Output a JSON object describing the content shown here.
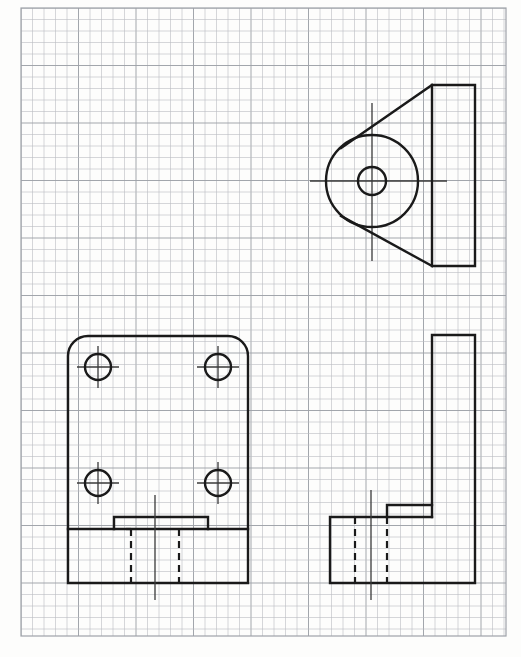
{
  "document": {
    "kind": "engineering-orthographic-drawing",
    "medium": "graph-paper",
    "title": "Three-view orthographic sketch of a bracket",
    "view_count": 3,
    "projection": "third-angle-style layout"
  },
  "canvas": {
    "width": 521,
    "height": 657,
    "background_color": "#fdfdfc"
  },
  "paper": {
    "name": "graph-paper-grid",
    "grid_spacing_px": 11.5,
    "grid_color": "#b9bcc1",
    "grid_major_color": "#9ea2a8",
    "grid_major_every": 5,
    "grid_left": 21,
    "grid_top": 8,
    "grid_right": 506,
    "grid_bottom": 636,
    "columns": 42,
    "rows": 55
  },
  "line_styles": {
    "visible_color": "#1a1a1a",
    "visible_width": 2.4,
    "hidden_color": "#1a1a1a",
    "hidden_width": 2.2,
    "hidden_dash": "7 5",
    "center_color": "#3a3a3a",
    "center_width": 1.3,
    "center_dash": "none"
  },
  "views": [
    {
      "id": "top-view",
      "label": "Top View",
      "position": "upper-right",
      "description": "Circular boss with two tangent lines running to a vertical rectangular plate",
      "bounds": {
        "x": 326,
        "y": 85,
        "width": 149,
        "height": 181
      },
      "features": {
        "large_circle": {
          "cx": 372,
          "cy": 181,
          "r": 46,
          "name": "boss-outer-circle"
        },
        "small_circle": {
          "cx": 372,
          "cy": 181,
          "r": 14,
          "name": "bore-circle"
        },
        "plate": {
          "x1": 432,
          "y1": 85,
          "x2": 475,
          "y2": 266,
          "name": "plate-rectangle"
        },
        "tangent_upper": {
          "x1": 432,
          "y1": 85,
          "x2": 341,
          "y2": 148,
          "name": "upper-tangent-line"
        },
        "tangent_lower": {
          "x1": 432,
          "y1": 266,
          "x2": 341,
          "y2": 216,
          "name": "lower-tangent-line"
        },
        "centerline_horizontal": {
          "x1": 310,
          "y1": 181,
          "x2": 447,
          "y2": 181
        },
        "centerline_vertical": {
          "x1": 372,
          "y1": 103,
          "x2": 372,
          "y2": 261
        }
      }
    },
    {
      "id": "front-view",
      "label": "Front View",
      "position": "lower-left",
      "description": "Rectangular face plate with rounded upper corners, four counterbored holes and a stepped base with a central hidden slot",
      "bounds": {
        "x": 68,
        "y": 336,
        "width": 180,
        "height": 247
      },
      "features": {
        "plate_outline": {
          "left": 68,
          "right": 248,
          "top": 336,
          "bottom": 583,
          "corner_radius": 20,
          "name": "plate-outline"
        },
        "holes": [
          {
            "cx": 98,
            "cy": 367,
            "r": 13,
            "name": "hole-top-left"
          },
          {
            "cx": 218,
            "cy": 367,
            "r": 13,
            "name": "hole-top-right"
          },
          {
            "cx": 98,
            "cy": 483,
            "r": 13,
            "name": "hole-bottom-left"
          },
          {
            "cx": 218,
            "cy": 483,
            "r": 13,
            "name": "hole-bottom-right"
          }
        ],
        "hole_count": 4,
        "base_step": {
          "shoulder_y": 529,
          "raised_y": 517,
          "raised_x1": 114,
          "raised_x2": 208,
          "name": "raised-rib"
        },
        "hidden_slot": {
          "x1": 131,
          "x2": 179,
          "y_top": 529,
          "y_bottom": 583,
          "name": "hidden-slot-lines"
        },
        "centerline_vertical": {
          "x1": 155,
          "y1": 495,
          "x2": 155,
          "y2": 600
        }
      }
    },
    {
      "id": "side-view",
      "label": "Right Side View",
      "position": "lower-right",
      "description": "L-shaped profile: horizontal base block with hidden slot and an upright vertical web",
      "bounds": {
        "x": 330,
        "y": 335,
        "width": 145,
        "height": 248
      },
      "features": {
        "vertical_web": {
          "x1": 432,
          "y1": 335,
          "x2": 475,
          "y2": 583,
          "name": "vertical-web"
        },
        "base_block": {
          "x1": 330,
          "y1": 517,
          "x2": 475,
          "y2": 583,
          "name": "base-block"
        },
        "notch": {
          "x1": 387,
          "y1": 505,
          "x2": 432,
          "y2": 517,
          "name": "base-notch"
        },
        "hidden_lines": [
          {
            "x": 355,
            "y_top": 517,
            "y_bottom": 583,
            "name": "hidden-line-left"
          },
          {
            "x": 387,
            "y_top": 517,
            "y_bottom": 583,
            "name": "hidden-line-right"
          }
        ],
        "centerline_vertical": {
          "x1": 371,
          "y1": 490,
          "x2": 371,
          "y2": 600
        }
      }
    }
  ],
  "annotations": {
    "dimensions_shown": false,
    "text_labels": [],
    "title_block": false
  }
}
